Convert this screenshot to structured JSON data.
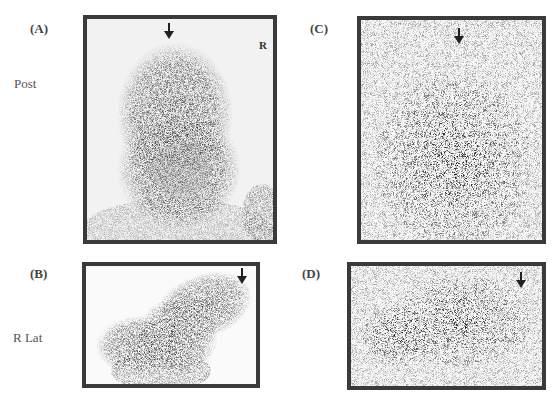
{
  "figure": {
    "panels": [
      {
        "id": "A",
        "label": "(A)",
        "view": "Post",
        "orientation_marker": "R",
        "type": "scintigraphy-dense"
      },
      {
        "id": "B",
        "label": "(B)",
        "view": "R Lat",
        "type": "scintigraphy-dense"
      },
      {
        "id": "C",
        "label": "(C)",
        "type": "scintigraphy-sparse"
      },
      {
        "id": "D",
        "label": "(D)",
        "type": "scintigraphy-sparse"
      }
    ],
    "row_labels": {
      "top": "Post",
      "bottom": "R Lat"
    },
    "arrow_icon": "down-arrow-icon",
    "colors": {
      "frame": "#3a3a3a",
      "uptake": "#1e1e1e",
      "background": "#f4f4f4"
    }
  }
}
